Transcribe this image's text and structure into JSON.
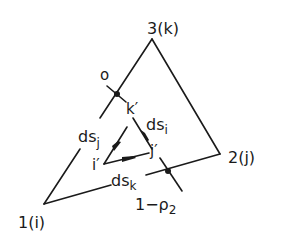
{
  "diagram": {
    "colors": {
      "stroke": "#1a1a1a",
      "background": "#ffffff"
    },
    "vertices": {
      "v1": {
        "label": "1(i)",
        "x": 44,
        "y": 204
      },
      "v2": {
        "label": "2(j)",
        "x": 220,
        "y": 154
      },
      "v3": {
        "label": "3(k)",
        "x": 152,
        "y": 39
      }
    },
    "inner_vertices": {
      "i_prime": {
        "label": "i′"
      },
      "j_prime": {
        "label": "j′"
      },
      "k_prime": {
        "label": "k′"
      }
    },
    "edge_labels": {
      "ds_i": {
        "main": "ds",
        "sub": "i"
      },
      "ds_j": {
        "main": "ds",
        "sub": "j"
      },
      "ds_k": {
        "main": "ds",
        "sub": "k"
      }
    },
    "points": {
      "o": {
        "label": "o"
      },
      "rho": {
        "main": "1−ρ",
        "sub": "2"
      }
    }
  }
}
